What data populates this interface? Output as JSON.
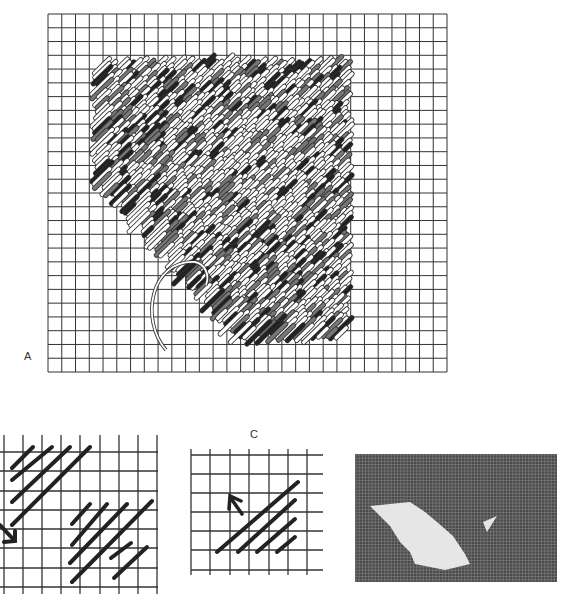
{
  "figures": {
    "a": {
      "label": "A",
      "description": "Grid with worked diagonal tent stitches in mixed tones, needle with thread loop at lower left",
      "grid": {
        "x": 48,
        "y": 14,
        "width": 400,
        "height": 358,
        "cols": 29,
        "rows": 26
      }
    },
    "b": {
      "label": "",
      "description": "Partial grid with two groups of diagonal stitches and an arrow",
      "grid": {
        "x": 0,
        "y": 414,
        "cols": 8,
        "rows": 9
      }
    },
    "c": {
      "label": "C",
      "description": "Grid with four diagonal stitches and an up-left arrow",
      "grid": {
        "x": 191,
        "y": 449,
        "cols": 7,
        "rows": 7
      }
    },
    "d": {
      "label": "",
      "description": "Photograph of canvas with light stitched diagonal shape",
      "canvas_color": "#4a4a4a",
      "stitch_color": "#e6e6e6"
    }
  },
  "colors": {
    "ink": "#222222",
    "grid_line": "#333333",
    "paper": "#ffffff"
  }
}
